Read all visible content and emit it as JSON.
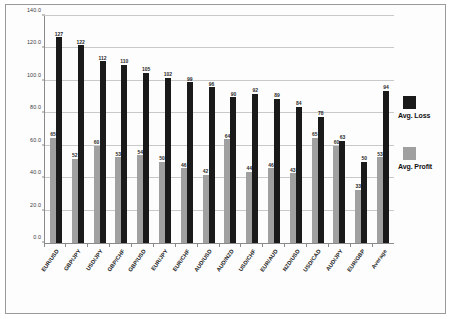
{
  "chart_data": {
    "type": "bar",
    "title": "",
    "subtitle": "",
    "xlabel": "",
    "ylabel": "",
    "ylim": [
      0,
      140
    ],
    "ytick_step": 20,
    "ytick_labels": [
      "0.0",
      "20.0",
      "40.0",
      "60.0",
      "80.0",
      "100.0",
      "120.0",
      "140.0"
    ],
    "grid": true,
    "legend_position": "right",
    "categories": [
      "EUR/USD",
      "GBP/JPY",
      "USD/JPY",
      "GBP/CHF",
      "GBP/USD",
      "EUR/JPY",
      "EUR/CHF",
      "AUD/USD",
      "AUD/NZD",
      "USD/CHF",
      "EUR/AUD",
      "NZD/USD",
      "USD/CAD",
      "AUD/JPY",
      "EUR/GBP",
      "Average"
    ],
    "series": [
      {
        "name": "Avg. Profit",
        "color": "#a0a0a0",
        "values": [
          65,
          52,
          60,
          53,
          54,
          50,
          46,
          42,
          64,
          44,
          46,
          43,
          65,
          60,
          33,
          53
        ]
      },
      {
        "name": "Avg. Loss",
        "color": "#1a1a1a",
        "values": [
          127,
          122,
          112,
          110,
          105,
          102,
          99,
          96,
          90,
          92,
          89,
          84,
          78,
          63,
          50,
          94
        ]
      }
    ]
  },
  "legend": {
    "entries": [
      {
        "label": "Avg. Loss",
        "swatch": "loss"
      },
      {
        "label": "Avg. Profit",
        "swatch": "profit"
      }
    ]
  }
}
